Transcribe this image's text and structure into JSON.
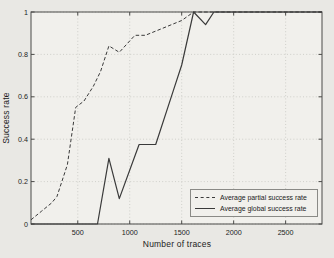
{
  "figure": {
    "background": "#e9e8e4",
    "plot_background": "#f1f0ec",
    "line_color": "#3a3a3a",
    "grid_color": "#c7c6c1",
    "frame_color": "#4a4a48",
    "text_color": "#222222"
  },
  "chart_data": {
    "type": "line",
    "title": "",
    "xlabel": "Number of traces",
    "ylabel": "Success rate",
    "xlim": [
      50,
      2850
    ],
    "ylim": [
      0,
      1
    ],
    "xticks": [
      500,
      1000,
      1500,
      2000,
      2500
    ],
    "yticks": [
      0,
      0.2,
      0.4,
      0.6,
      0.8,
      1
    ],
    "grid": true,
    "legend_position": "lower right",
    "series": [
      {
        "name": "Average partial success rate",
        "style": "dashed",
        "points": [
          [
            50,
            0.02
          ],
          [
            150,
            0.06
          ],
          [
            250,
            0.1
          ],
          [
            300,
            0.13
          ],
          [
            400,
            0.28
          ],
          [
            480,
            0.55
          ],
          [
            560,
            0.58
          ],
          [
            650,
            0.65
          ],
          [
            720,
            0.72
          ],
          [
            800,
            0.84
          ],
          [
            900,
            0.81
          ],
          [
            1050,
            0.89
          ],
          [
            1150,
            0.89
          ],
          [
            1300,
            0.92
          ],
          [
            1500,
            0.96
          ],
          [
            1615,
            1.0
          ],
          [
            2850,
            1.0
          ]
        ]
      },
      {
        "name": "Average global success rate",
        "style": "solid",
        "points": [
          [
            50,
            0
          ],
          [
            690,
            0
          ],
          [
            800,
            0.31
          ],
          [
            900,
            0.12
          ],
          [
            1090,
            0.375
          ],
          [
            1250,
            0.375
          ],
          [
            1420,
            0.63
          ],
          [
            1500,
            0.75
          ],
          [
            1615,
            1.0
          ],
          [
            1730,
            0.94
          ],
          [
            1810,
            1.0
          ],
          [
            2850,
            1.0
          ]
        ]
      }
    ]
  }
}
